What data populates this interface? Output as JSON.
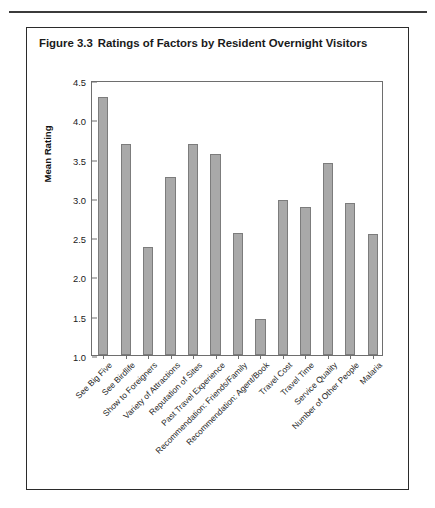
{
  "figure": {
    "number": "Figure 3.3",
    "title": "Ratings of Factors by Resident Overnight Visitors"
  },
  "chart_data": {
    "type": "bar",
    "title": "Ratings of Factors by Resident Overnight Visitors",
    "xlabel": "",
    "ylabel": "Mean Rating",
    "ylim": [
      1.0,
      4.5
    ],
    "yticks": [
      "1.0",
      "1.5",
      "2.0",
      "2.5",
      "3.0",
      "3.5",
      "4.0",
      "4.5"
    ],
    "ytick_values": [
      1.0,
      1.5,
      2.0,
      2.5,
      3.0,
      3.5,
      4.0,
      4.5
    ],
    "grid": false,
    "legend": "none",
    "bar_color": "#a9a9a9",
    "bar_edge_color": "#7c7c7c",
    "categories": [
      "See Big Five",
      "See Birdlife",
      "Show to Foreigners",
      "Variety of Attractions",
      "Reputation of Sites",
      "Past Travel Experience",
      "Recommendation: Friends/Family",
      "Recommendation: Agent/Book",
      "Travel Cost",
      "Travel Time",
      "Service Quality",
      "Number of Other People",
      "Malaria"
    ],
    "values": [
      4.28,
      3.68,
      2.37,
      3.26,
      3.68,
      3.56,
      2.55,
      1.46,
      2.97,
      2.88,
      3.44,
      2.94,
      2.54
    ]
  }
}
